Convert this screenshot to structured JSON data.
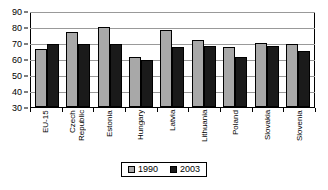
{
  "chart_data": {
    "type": "bar",
    "title": "",
    "subtitle": "",
    "xlabel": "",
    "ylabel": "",
    "ylim": [
      30,
      90
    ],
    "yticks": [
      30,
      40,
      50,
      60,
      70,
      80,
      90
    ],
    "grid": true,
    "legend_position": "bottom",
    "categories": [
      "EU-15",
      "Czech Republic",
      "Estonia",
      "Hungary",
      "Latvia",
      "Lithuania",
      "Poland",
      "Slovakia",
      "Slovenia"
    ],
    "category_lines": [
      [
        "EU-15"
      ],
      [
        "Czech",
        "Republic"
      ],
      [
        "Estonia"
      ],
      [
        "Hungary"
      ],
      [
        "Latvia"
      ],
      [
        "Lithuania"
      ],
      [
        "Poland"
      ],
      [
        "Slovakia"
      ],
      [
        "Slovenia"
      ]
    ],
    "series": [
      {
        "name": "1990",
        "color": "#a8a8a8",
        "values": [
          67,
          78,
          81,
          62,
          79,
          73,
          68,
          71,
          70
        ]
      },
      {
        "name": "2003",
        "color": "#1a1a1a",
        "values": [
          70,
          70,
          70,
          60,
          68,
          69,
          62,
          69,
          66
        ]
      }
    ]
  },
  "axis": {
    "y_tick_labels": [
      "90",
      "80",
      "70",
      "60",
      "50",
      "40",
      "30"
    ]
  },
  "legend": {
    "entries": [
      {
        "label": "1990",
        "swatch": "legend-swatch-1990"
      },
      {
        "label": "2003",
        "swatch": "legend-swatch-2003"
      }
    ]
  }
}
